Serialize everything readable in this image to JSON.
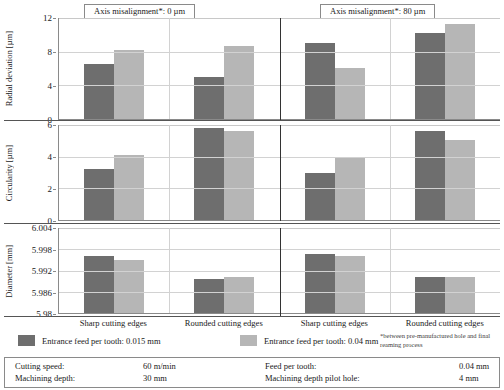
{
  "panel_titles": {
    "left": "Axis misalignment*: 0 µm",
    "right": "Axis misalignment*: 80 µm"
  },
  "legend": {
    "series1_label": "Entrance feed per tooth: 0.015 mm",
    "series2_label": "Entrance feed per tooth: 0.04 mm",
    "series1_color": "#6e6e6e",
    "series2_color": "#b6b6b6",
    "footnote": "*between pre-manufactured hole and final reaming process"
  },
  "params": {
    "cutting_speed_key": "Cutting speed:",
    "cutting_speed_val": "60 m/min",
    "machining_depth_key": "Machining depth:",
    "machining_depth_val": "30 mm",
    "feed_per_tooth_key": "Feed per tooth:",
    "feed_per_tooth_val": "0.04 mm",
    "pilot_hole_key": "Machining depth pilot hole:",
    "pilot_hole_val": "4 mm"
  },
  "categories": [
    "Sharp cutting edges",
    "Rounded cutting edges",
    "Sharp cutting edges",
    "Rounded cutting edges"
  ],
  "chart_data": [
    {
      "type": "bar",
      "id": "radial-deviation",
      "title": "",
      "ylabel": "Radial deviation [µm]",
      "xlabel": "",
      "ylim": [
        0,
        12
      ],
      "yticks": [
        0,
        4,
        8,
        12
      ],
      "ytick_labels": [
        "0",
        "4",
        "8",
        "12"
      ],
      "grid": true,
      "categories": [
        "Sharp cutting edges",
        "Rounded cutting edges",
        "Sharp cutting edges",
        "Rounded cutting edges"
      ],
      "panels": [
        "Axis misalignment*: 0 µm",
        "Axis misalignment*: 0 µm",
        "Axis misalignment*: 80 µm",
        "Axis misalignment*: 80 µm"
      ],
      "series": [
        {
          "name": "Entrance feed per tooth: 0.015 mm",
          "color": "#6e6e6e",
          "values": [
            6.5,
            5.0,
            9.0,
            10.2
          ]
        },
        {
          "name": "Entrance feed per tooth: 0.04 mm",
          "color": "#b6b6b6",
          "values": [
            8.2,
            8.7,
            6.1,
            11.3
          ]
        }
      ]
    },
    {
      "type": "bar",
      "id": "circularity",
      "title": "",
      "ylabel": "Circularity [µm]",
      "xlabel": "",
      "ylim": [
        0,
        6
      ],
      "yticks": [
        0,
        2,
        4,
        6
      ],
      "ytick_labels": [
        "0",
        "2",
        "4",
        "6"
      ],
      "grid": true,
      "categories": [
        "Sharp cutting edges",
        "Rounded cutting edges",
        "Sharp cutting edges",
        "Rounded cutting edges"
      ],
      "panels": [
        "Axis misalignment*: 0 µm",
        "Axis misalignment*: 0 µm",
        "Axis misalignment*: 80 µm",
        "Axis misalignment*: 80 µm"
      ],
      "series": [
        {
          "name": "Entrance feed per tooth: 0.015 mm",
          "color": "#6e6e6e",
          "values": [
            3.2,
            5.8,
            3.0,
            5.6
          ]
        },
        {
          "name": "Entrance feed per tooth: 0.04 mm",
          "color": "#b6b6b6",
          "values": [
            4.1,
            5.65,
            4.0,
            5.05
          ]
        }
      ]
    },
    {
      "type": "bar",
      "id": "diameter",
      "title": "",
      "ylabel": "Diameter [mm]",
      "xlabel": "",
      "ylim": [
        5.98,
        6.004
      ],
      "yticks": [
        5.98,
        5.986,
        5.992,
        5.998,
        6.004
      ],
      "ytick_labels": [
        "5.98",
        "5.986",
        "5.992",
        "5.998",
        "6.004"
      ],
      "grid": true,
      "categories": [
        "Sharp cutting edges",
        "Rounded cutting edges",
        "Sharp cutting edges",
        "Rounded cutting edges"
      ],
      "panels": [
        "Axis misalignment*: 0 µm",
        "Axis misalignment*: 0 µm",
        "Axis misalignment*: 80 µm",
        "Axis misalignment*: 80 µm"
      ],
      "series": [
        {
          "name": "Entrance feed per tooth: 0.015 mm",
          "color": "#6e6e6e",
          "values": [
            5.9962,
            5.9896,
            5.9966,
            5.9903
          ]
        },
        {
          "name": "Entrance feed per tooth: 0.04 mm",
          "color": "#b6b6b6",
          "values": [
            5.995,
            5.9902,
            5.9962,
            5.9903
          ]
        }
      ]
    }
  ]
}
